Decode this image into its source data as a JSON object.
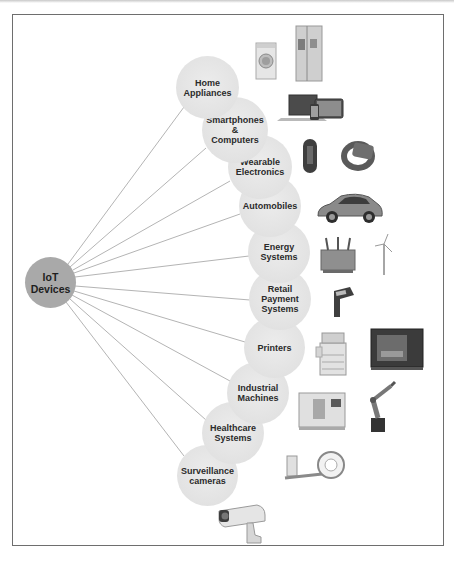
{
  "diagram": {
    "root": {
      "label": "IoT Devices",
      "lines": [
        "IoT",
        "Devices"
      ]
    },
    "categories": [
      {
        "label": "Home Appliances",
        "lines": [
          "Home",
          "Appliances"
        ],
        "images": [
          "washing-machine",
          "refrigerator"
        ]
      },
      {
        "label": "Smartphones & Computers",
        "lines": [
          "Smartphones",
          "&",
          "Computers"
        ],
        "images": [
          "laptop-tablet-phone"
        ]
      },
      {
        "label": "Wearable Electronics",
        "lines": [
          "Wearable",
          "Electronics"
        ],
        "images": [
          "fitness-band",
          "smartwatch"
        ]
      },
      {
        "label": "Automobiles",
        "lines": [
          "Automobiles"
        ],
        "images": [
          "car"
        ]
      },
      {
        "label": "Energy Systems",
        "lines": [
          "Energy",
          "Systems"
        ],
        "images": [
          "transformer",
          "wind-turbine"
        ]
      },
      {
        "label": "Retail Payment Systems",
        "lines": [
          "Retail",
          "Payment",
          "Systems"
        ],
        "images": [
          "card-payment-terminal"
        ]
      },
      {
        "label": "Printers",
        "lines": [
          "Printers"
        ],
        "images": [
          "office-printer",
          "3d-printer"
        ]
      },
      {
        "label": "Industrial Machines",
        "lines": [
          "Industrial",
          "Machines"
        ],
        "images": [
          "cnc-machine",
          "robot-arm"
        ]
      },
      {
        "label": "Healthcare Systems",
        "lines": [
          "Healthcare",
          "Systems"
        ],
        "images": [
          "ct-scanner"
        ]
      },
      {
        "label": "Surveillance cameras",
        "lines": [
          "Surveillance",
          "cameras"
        ],
        "images": [
          "security-camera"
        ]
      }
    ],
    "colors": {
      "root_fill": "#a9a9a9",
      "category_fill": "#e4e4e4",
      "line": "#b4b4b4",
      "frame": "#6e6e6e",
      "text": "#2b2b2b"
    }
  }
}
